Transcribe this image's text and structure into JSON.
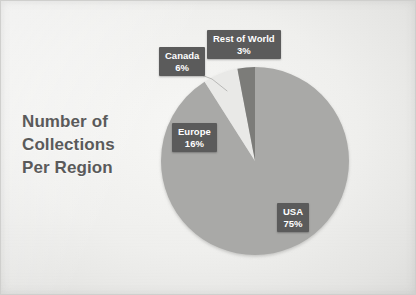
{
  "slide": {
    "background_color": "#f1f1ef",
    "border_color": "#cfcfcd"
  },
  "title": {
    "lines": [
      "Number of",
      "Collections",
      "Per Region"
    ],
    "full_text": "Number of Collections Per Region",
    "color": "#5a5a5a"
  },
  "labels": {
    "usa": {
      "name": "USA",
      "value": "75%"
    },
    "europe": {
      "name": "Europe",
      "value": "16%"
    },
    "canada": {
      "name": "Canada",
      "value": "6%"
    },
    "rest_of_world": {
      "name": "Rest of World",
      "value": "3%"
    }
  },
  "chart_data": {
    "type": "pie",
    "title": "Number of Collections Per Region",
    "subtitle": "",
    "xlabel": "",
    "ylabel": "",
    "value_unit": "percent",
    "total": 100,
    "legend_position": "none",
    "data_labels": "name and percentage, inside/outside callouts",
    "grid": false,
    "start_angle_deg": 0,
    "direction": "clockwise",
    "categories": [
      "USA",
      "Europe",
      "Canada",
      "Rest of World"
    ],
    "values": [
      75,
      16,
      6,
      3
    ],
    "slice_colors": [
      "#a9a9a7",
      "#a9a9a7",
      "#e9e9e7",
      "#7b7b79"
    ],
    "slices": [
      {
        "label": "USA",
        "value": 75,
        "display": "75%",
        "color": "#a9a9a7",
        "label_placement": "inside"
      },
      {
        "label": "Europe",
        "value": 16,
        "display": "16%",
        "color": "#a9a9a7",
        "label_placement": "inside"
      },
      {
        "label": "Canada",
        "value": 6,
        "display": "6%",
        "color": "#e9e9e7",
        "label_placement": "outside-callout"
      },
      {
        "label": "Rest of World",
        "value": 3,
        "display": "3%",
        "color": "#7b7b79",
        "label_placement": "outside-callout"
      }
    ],
    "annotations": [
      "Canada 6% label connected to its slice by a leader line"
    ]
  },
  "geometry": {
    "center_x": 255,
    "center_y": 161,
    "radius": 94
  }
}
